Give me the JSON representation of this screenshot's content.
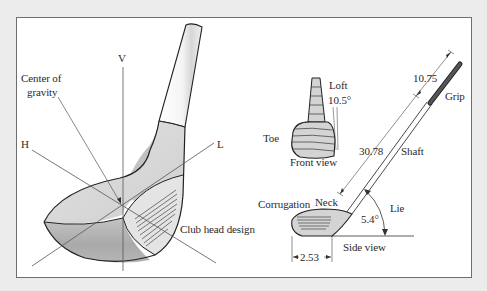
{
  "figure": {
    "main_view": {
      "axis_labels": {
        "vertical": "V",
        "horizontal": "H",
        "longitudinal": "L"
      },
      "center_of_gravity_line1": "Center of",
      "center_of_gravity_line2": "gravity",
      "club_head_design": "Club head design"
    },
    "front_view": {
      "title": "Front view",
      "loft_label": "Loft",
      "loft_value": "10.5°",
      "toe_label": "Toe"
    },
    "side_view": {
      "title": "Side view",
      "grip_label": "Grip",
      "grip_length": "10.75",
      "shaft_label": "Shaft",
      "shaft_length": "30.78",
      "neck_label": "Neck",
      "corrugation_label": "Corrugation",
      "lie_label": "Lie",
      "lie_angle": "5.4°",
      "head_length": "2.53"
    }
  },
  "colors": {
    "background": "#ececec",
    "panel": "#ffffff",
    "frame": "#6e6e6e",
    "ink": "#2a2a2a",
    "head_light": "#d9d9d9",
    "head_mid": "#bdbdbd",
    "head_dark": "#a3a3a3",
    "grip": "#555555"
  }
}
